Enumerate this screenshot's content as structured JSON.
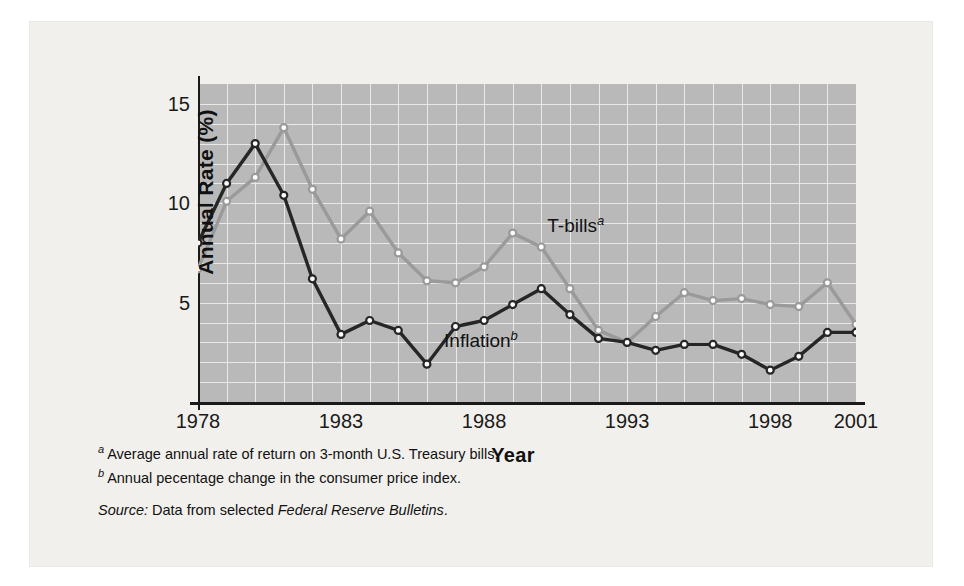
{
  "chart_data": {
    "type": "line",
    "title": "",
    "xlabel": "Year",
    "ylabel": "Annual Rate (%)",
    "x": [
      1978,
      1979,
      1980,
      1981,
      1982,
      1983,
      1984,
      1985,
      1986,
      1987,
      1988,
      1989,
      1990,
      1991,
      1992,
      1993,
      1994,
      1995,
      1996,
      1997,
      1998,
      1999,
      2000,
      2001
    ],
    "xlim": [
      1978,
      2001
    ],
    "ylim": [
      0,
      16
    ],
    "xticks": [
      "1978",
      "1983",
      "1988",
      "1993",
      "1998",
      "2001"
    ],
    "xtick_values": [
      1978,
      1983,
      1988,
      1993,
      1998,
      2001
    ],
    "yticks": [
      "5",
      "10",
      "15"
    ],
    "ytick_values": [
      5,
      10,
      15
    ],
    "grid": "on, white 1-unit gridlines on gray panel",
    "legend_position": "inline labels on plot",
    "series": [
      {
        "name": "T-bills",
        "label": "T-bills",
        "footnote_marker": "a",
        "color": "#9a9a9a",
        "marker": "open-circle",
        "values": [
          6.7,
          10.1,
          11.3,
          13.8,
          10.7,
          8.2,
          9.6,
          7.5,
          6.1,
          6.0,
          6.8,
          8.5,
          7.8,
          5.7,
          3.6,
          3.0,
          4.3,
          5.5,
          5.1,
          5.2,
          4.9,
          4.8,
          6.0,
          3.9
        ]
      },
      {
        "name": "Inflation",
        "label": "Inflation",
        "footnote_marker": "b",
        "color": "#262626",
        "marker": "open-circle",
        "values": [
          8.0,
          11.0,
          13.0,
          10.4,
          6.2,
          3.4,
          4.1,
          3.6,
          1.9,
          3.8,
          4.1,
          4.9,
          5.7,
          4.4,
          3.2,
          3.0,
          2.6,
          2.9,
          2.9,
          2.4,
          1.6,
          2.3,
          3.5,
          3.5
        ]
      }
    ]
  },
  "axes": {
    "y_title": "Annual Rate (%)",
    "x_title": "Year"
  },
  "labels": {
    "tbills": "T-bills",
    "tbills_sup": "a",
    "inflation": "Inflation",
    "inflation_sup": "b"
  },
  "notes": [
    {
      "marker": "a",
      "text": "Average annual rate of return on 3-month U.S. Treasury bills."
    },
    {
      "marker": "b",
      "text": "Annual pecentage change in the consumer price index."
    }
  ],
  "source": {
    "prefix": "Source:",
    "middle": " Data from selected ",
    "italic": "Federal Reserve Bulletins",
    "suffix": "."
  },
  "colors": {
    "panel": "#b9b9b9",
    "gridline": "#e9e9e9",
    "figure_background": "#f2f0ec",
    "axis": "#1a1a1a",
    "tbills": "#9a9a9a",
    "inflation": "#262626"
  }
}
